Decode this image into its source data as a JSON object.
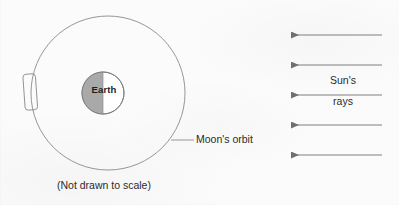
{
  "diagram": {
    "caption": "(Not drawn to scale)",
    "labels": {
      "earth": "Earth",
      "moon_orbit": "Moon's orbit",
      "sun_rays_line1": "Sun's",
      "sun_rays_line2": "rays"
    },
    "colors": {
      "background": "#fbfbfb",
      "stroke": "#7d7d7d",
      "earth_shadow_half": "#a8a8a8",
      "earth_lit_half": "#ffffff",
      "text": "#2b2b2b"
    },
    "geometry": {
      "orbit_circle": {
        "cx": 108,
        "cy": 93,
        "r": 77
      },
      "earth": {
        "cx": 103,
        "cy": 93,
        "r": 21,
        "shaded_side": "left"
      },
      "moon": {
        "x": 24,
        "y": 74,
        "width": 12,
        "height": 36,
        "position_on_orbit": "left"
      },
      "sun_ray_arrows": {
        "count": 5,
        "direction": "right-to-left",
        "x_start": 382,
        "x_end": 290,
        "y_positions": [
          35,
          65,
          95,
          125,
          155
        ]
      },
      "orbit_leader_line": {
        "x1": 172,
        "y1": 140,
        "x2": 194,
        "y2": 140
      }
    }
  }
}
